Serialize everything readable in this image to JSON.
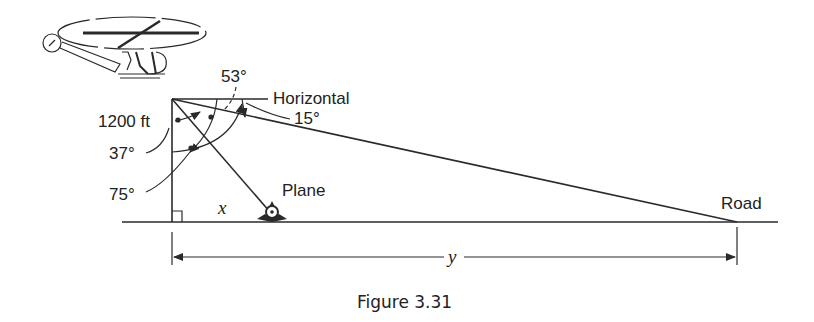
{
  "figure": {
    "caption": "Figure 3.31",
    "labels": {
      "horizontal": "Horizontal",
      "angle_53": "53°",
      "angle_15": "15°",
      "height": "1200 ft",
      "angle_37": "37°",
      "angle_75": "75°",
      "plane": "Plane",
      "road": "Road",
      "x": "x",
      "y": "y"
    },
    "objects": [
      "helicopter-icon",
      "plane-icon"
    ],
    "colors": {
      "ink": "#2a2a2a",
      "background": "#ffffff"
    }
  }
}
